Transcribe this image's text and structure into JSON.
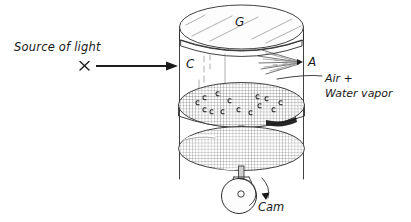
{
  "figure": {
    "kind": "schematic-diagram",
    "background_color": "#ffffff",
    "ink_color": "#2b2b2b"
  },
  "labels": {
    "source_of_light": "Source of light",
    "glass_top": "G",
    "chamber": "C",
    "nozzle": "A",
    "gas_line1": "Air +",
    "gas_line2": "Water vapor",
    "cam": "Cam",
    "source_marker": "×"
  },
  "parts": {
    "glass_plate": {
      "label": "G",
      "description": "transparent glass top plate"
    },
    "chamber_wall": {
      "label": "C",
      "description": "cylindrical chamber wall"
    },
    "spray_nozzle": {
      "label": "A",
      "description": "nozzle spraying into chamber"
    },
    "contents": {
      "label": "Air + Water vapor",
      "description": "chamber contents"
    },
    "upper_piston": {
      "description": "hatched piston disc with condensation droplets"
    },
    "lower_piston": {
      "description": "hatched lower disc on piston rod"
    },
    "cam_wheel": {
      "label": "Cam",
      "description": "rotating cam driving the piston"
    }
  },
  "annotations": {
    "light_arrow": "horizontal arrow from source marker into chamber",
    "cam_rotation_arrow": "curved arrow indicating cam rotation"
  }
}
